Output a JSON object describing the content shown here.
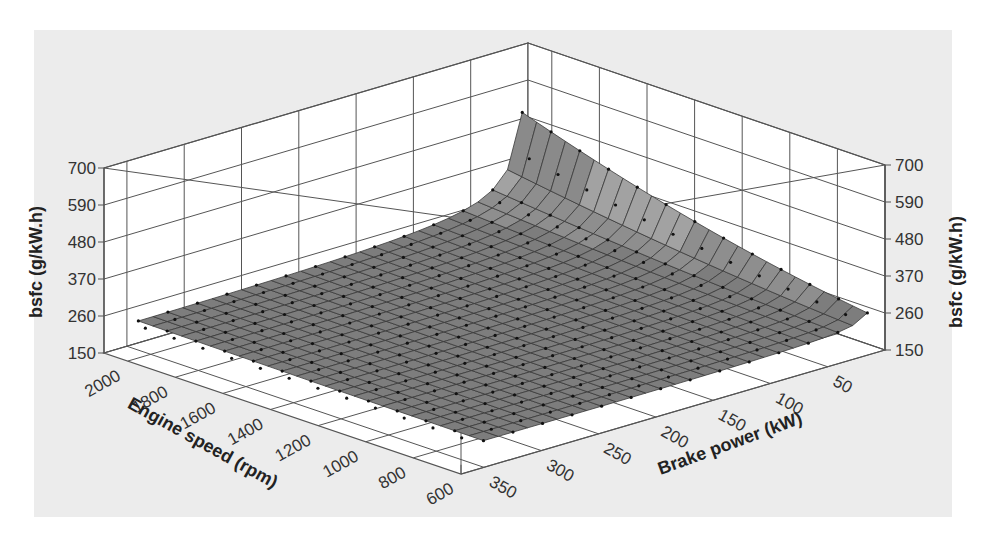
{
  "chart_data": {
    "type": "surface3d",
    "title": "",
    "x_axis": {
      "label": "Engine speed (rpm)",
      "ticks": [
        2000,
        1800,
        1600,
        1400,
        1200,
        1000,
        800,
        600
      ],
      "range": [
        600,
        2100
      ]
    },
    "y_axis": {
      "label": "Brake power (kW)",
      "ticks": [
        50,
        100,
        150,
        200,
        250,
        300,
        350
      ],
      "range": [
        0,
        370
      ]
    },
    "z_axis": {
      "label": "bsfc (g/kW.h)",
      "ticks": [
        150,
        260,
        370,
        480,
        590,
        700
      ],
      "range": [
        150,
        700
      ]
    },
    "grid": true,
    "surface_description": "bsfc surface with measured points; flat ~200-240 g/kW.h across most of map, rising steeply to ~680 g/kW.h at low brake power and high engine speed",
    "sample_points": [
      {
        "speed": 2100,
        "power": 5,
        "bsfc": 680
      },
      {
        "speed": 2100,
        "power": 20,
        "bsfc": 560
      },
      {
        "speed": 2100,
        "power": 50,
        "bsfc": 400
      },
      {
        "speed": 1600,
        "power": 10,
        "bsfc": 500
      },
      {
        "speed": 1200,
        "power": 10,
        "bsfc": 400
      },
      {
        "speed": 600,
        "power": 10,
        "bsfc": 300
      },
      {
        "speed": 2100,
        "power": 350,
        "bsfc": 245
      },
      {
        "speed": 600,
        "power": 350,
        "bsfc": 220
      },
      {
        "speed": 1400,
        "power": 200,
        "bsfc": 210
      }
    ]
  },
  "labels": {
    "z_left": "bsfc (g/kW.h)",
    "z_right": "bsfc (g/kW.h)",
    "x": "Engine speed (rpm)",
    "y": "Brake power (kW)"
  }
}
